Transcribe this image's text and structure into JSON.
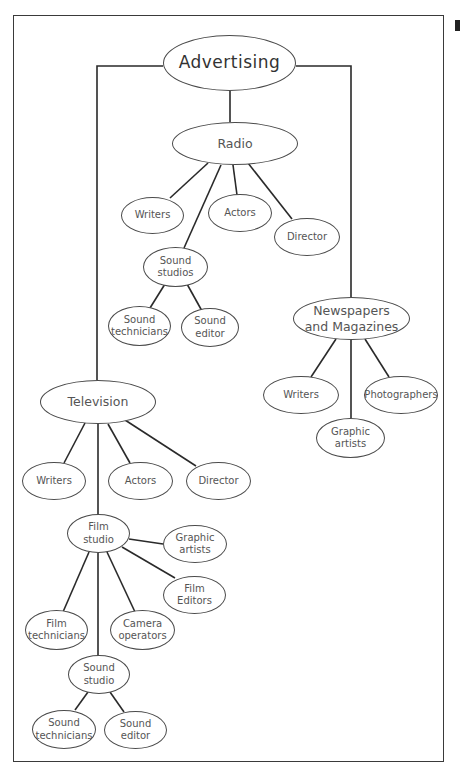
{
  "diagram": {
    "title": "Advertising",
    "root": "Advertising",
    "radio": {
      "label": "Radio",
      "writers": "Writers",
      "actors": "Actors",
      "director": "Director",
      "sound_studios": "Sound\nstudios",
      "sound_technicians": "Sound\ntechnicians",
      "sound_editor": "Sound\neditor"
    },
    "newspapers": {
      "label": "Newspapers\nand Magazines",
      "writers": "Writers",
      "photographers": "Photographers",
      "graphic_artists": "Graphic\nartists"
    },
    "television": {
      "label": "Television",
      "writers": "Writers",
      "actors": "Actors",
      "director": "Director",
      "film_studio": "Film\nstudio",
      "graphic_artists": "Graphic\nartists",
      "film_editors": "Film\nEditors",
      "film_technicians": "Film\ntechnicians",
      "camera_operators": "Camera\noperators",
      "sound_studio": "Sound\nstudio",
      "sound_technicians": "Sound\ntechnicians",
      "sound_editor": "Sound\neditor"
    },
    "colors": {
      "line": "#2a2a2a",
      "node_border": "#4a4a4a",
      "text": "#555555"
    }
  }
}
